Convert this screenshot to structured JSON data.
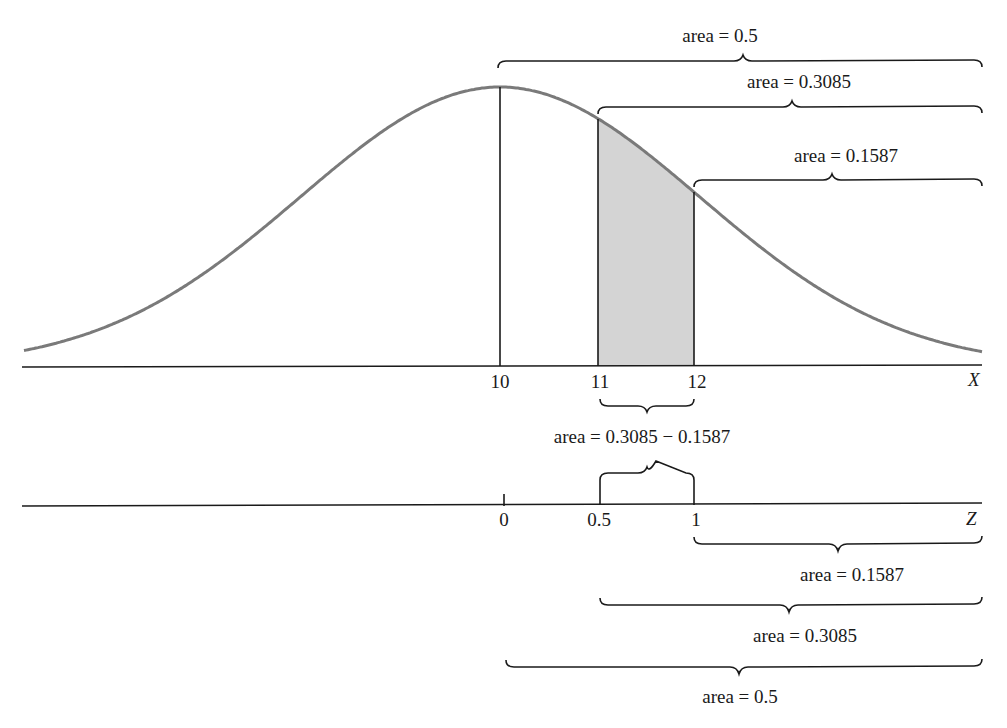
{
  "chart_data": {
    "type": "area",
    "title": "",
    "x_axis": {
      "label": "X",
      "ticks": [
        "10",
        "11",
        "12"
      ]
    },
    "z_axis": {
      "label": "Z",
      "ticks": [
        "0",
        "0.5",
        "1"
      ]
    },
    "shaded_region": {
      "x_from": 11,
      "x_to": 12,
      "z_from": 0.5,
      "z_to": 1
    },
    "top_braces": [
      {
        "from": "10",
        "to": "right end",
        "label": "area = 0.5"
      },
      {
        "from": "11",
        "to": "right end",
        "label": "area = 0.3085"
      },
      {
        "from": "12",
        "to": "right end",
        "label": "area = 0.1587"
      }
    ],
    "middle_brace": {
      "from": "11",
      "to": "12",
      "label": "area = 0.3085 − 0.1587"
    },
    "bottom_braces": [
      {
        "from": "1",
        "to": "right end",
        "label": "area = 0.1587"
      },
      {
        "from": "0.5",
        "to": "right end",
        "label": "area = 0.3085"
      },
      {
        "from": "0",
        "to": "right end",
        "label": "area = 0.5"
      }
    ]
  },
  "labels": {
    "top_half": "area = 0.5",
    "top_3085": "area = 0.3085",
    "top_1587": "area = 0.1587",
    "middle_diff": "area = 0.3085 − 0.1587",
    "bottom_1587": "area = 0.1587",
    "bottom_3085": "area = 0.3085",
    "bottom_half": "area = 0.5",
    "x_axis": "X",
    "z_axis": "Z",
    "x_ticks": [
      "10",
      "11",
      "12"
    ],
    "z_ticks": [
      "0",
      "0.5",
      "1"
    ]
  },
  "colors": {
    "curve": "#7a7a7a",
    "shade": "#d4d4d4",
    "ink": "#1a1a1a"
  }
}
